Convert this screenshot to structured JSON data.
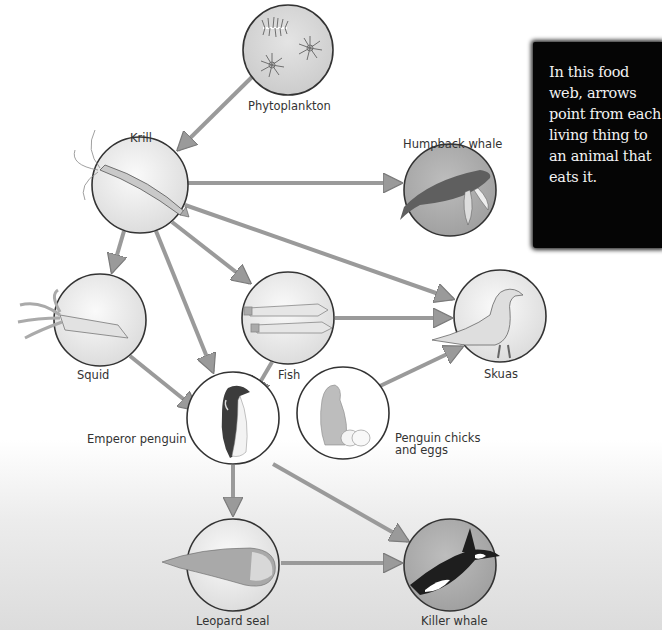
{
  "diagram": {
    "type": "food-web",
    "note": "In this food web, arrows point from each living thing to an animal that eats it.",
    "nodes": [
      {
        "id": "phytoplankton",
        "label": "Phytoplankton"
      },
      {
        "id": "krill",
        "label": "Krill"
      },
      {
        "id": "humpback",
        "label": "Humpback whale"
      },
      {
        "id": "squid",
        "label": "Squid"
      },
      {
        "id": "fish",
        "label": "Fish"
      },
      {
        "id": "skuas",
        "label": "Skuas"
      },
      {
        "id": "emperor",
        "label": "Emperor penguin"
      },
      {
        "id": "chicks",
        "label_line1": "Penguin chicks",
        "label_line2": "and eggs"
      },
      {
        "id": "leopard",
        "label": "Leopard seal"
      },
      {
        "id": "orca",
        "label": "Killer whale"
      }
    ],
    "edges": [
      {
        "from": "Phytoplankton",
        "to": "Krill"
      },
      {
        "from": "Krill",
        "to": "Humpback whale"
      },
      {
        "from": "Krill",
        "to": "Squid"
      },
      {
        "from": "Krill",
        "to": "Fish"
      },
      {
        "from": "Krill",
        "to": "Emperor penguin"
      },
      {
        "from": "Krill",
        "to": "Skuas"
      },
      {
        "from": "Squid",
        "to": "Emperor penguin"
      },
      {
        "from": "Fish",
        "to": "Emperor penguin"
      },
      {
        "from": "Fish",
        "to": "Skuas"
      },
      {
        "from": "Penguin chicks and eggs",
        "to": "Skuas"
      },
      {
        "from": "Emperor penguin",
        "to": "Leopard seal"
      },
      {
        "from": "Emperor penguin",
        "to": "Killer whale"
      },
      {
        "from": "Leopard seal",
        "to": "Killer whale"
      }
    ],
    "colors": {
      "arrow": "#9a9a9a",
      "circle_stroke": "#333333",
      "note_bg": "#050505",
      "note_text": "#f2f2f2"
    }
  }
}
